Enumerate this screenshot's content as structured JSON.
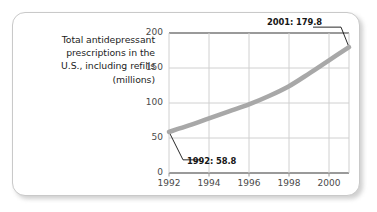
{
  "caption": {
    "lines": [
      "Total antidepressant",
      "prescriptions in the",
      "U.S., including refills",
      "(millions)"
    ]
  },
  "chart_data": {
    "type": "line",
    "title": "Total antidepressant prescriptions in the U.S., including refills (millions)",
    "xlabel": "",
    "ylabel": "millions",
    "xlim": [
      1992,
      2001
    ],
    "ylim": [
      0,
      200
    ],
    "grid": true,
    "legend": "none",
    "line_color": "#a8a8a8",
    "x": [
      1992,
      1993,
      1994,
      1995,
      1996,
      1997,
      1998,
      1999,
      2000,
      2001
    ],
    "values": [
      58.8,
      68.0,
      78.0,
      88.0,
      98.0,
      110.0,
      124.0,
      142.0,
      161.0,
      179.8
    ],
    "series": [
      {
        "name": "Total antidepressant prescriptions",
        "values": [
          58.8,
          68.0,
          78.0,
          88.0,
          98.0,
          110.0,
          124.0,
          142.0,
          161.0,
          179.8
        ]
      }
    ],
    "xticks": [
      1992,
      1994,
      1996,
      1998,
      2000
    ],
    "xtick_labels": [
      "1992",
      "1994",
      "1996",
      "1998",
      "2000"
    ],
    "yticks": [
      0,
      50,
      100,
      150,
      200
    ],
    "ytick_labels": [
      "0",
      "50",
      "100",
      "150",
      "200"
    ],
    "annotations": [
      {
        "label": "1992: 58.8",
        "x": 1992,
        "y": 58.8
      },
      {
        "label": "2001: 179.8",
        "x": 2001,
        "y": 179.8
      }
    ]
  }
}
